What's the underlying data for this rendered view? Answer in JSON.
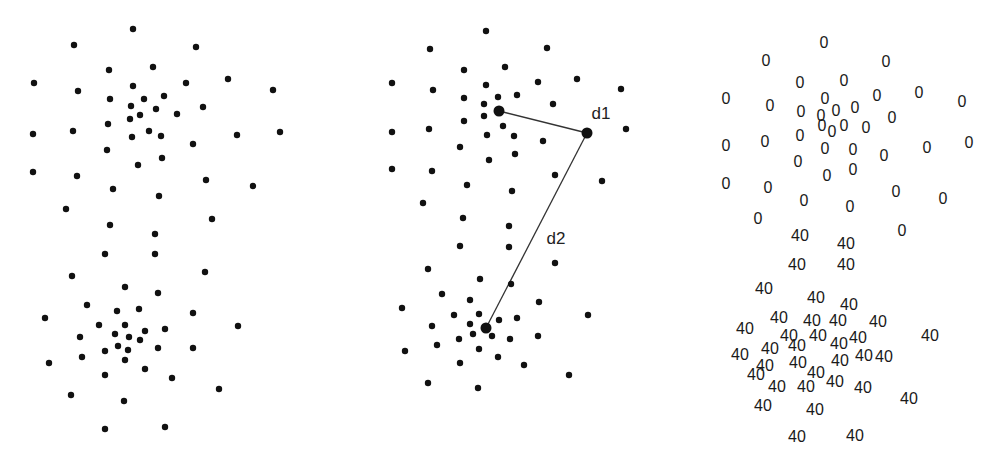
{
  "figure": {
    "panels": [
      {
        "id": "panel-raw-points",
        "description": "Two clusters of unlabeled points",
        "point_radius": 3.2,
        "points": [
          [
            133,
            29
          ],
          [
            74,
            45
          ],
          [
            196,
            47
          ],
          [
            109,
            70
          ],
          [
            153,
            67
          ],
          [
            34,
            83
          ],
          [
            78,
            91
          ],
          [
            133,
            86
          ],
          [
            186,
            83
          ],
          [
            228,
            79
          ],
          [
            273,
            90
          ],
          [
            110,
            99
          ],
          [
            144,
            99
          ],
          [
            164,
            96
          ],
          [
            131,
            106
          ],
          [
            156,
            109
          ],
          [
            177,
            114
          ],
          [
            203,
            107
          ],
          [
            130,
            119
          ],
          [
            140,
            115
          ],
          [
            108,
            124
          ],
          [
            33,
            134
          ],
          [
            73,
            131
          ],
          [
            132,
            137
          ],
          [
            149,
            131
          ],
          [
            161,
            136
          ],
          [
            237,
            135
          ],
          [
            280,
            132
          ],
          [
            193,
            144
          ],
          [
            107,
            150
          ],
          [
            138,
            165
          ],
          [
            162,
            158
          ],
          [
            33,
            172
          ],
          [
            77,
            176
          ],
          [
            113,
            189
          ],
          [
            206,
            180
          ],
          [
            253,
            186
          ],
          [
            66,
            209
          ],
          [
            159,
            196
          ],
          [
            110,
            225
          ],
          [
            212,
            219
          ],
          [
            155,
            234
          ],
          [
            105,
            254
          ],
          [
            155,
            254
          ],
          [
            72,
            276
          ],
          [
            205,
            272
          ],
          [
            125,
            287
          ],
          [
            158,
            293
          ],
          [
            87,
            305
          ],
          [
            117,
            311
          ],
          [
            139,
            309
          ],
          [
            193,
            313
          ],
          [
            45,
            318
          ],
          [
            99,
            325
          ],
          [
            125,
            325
          ],
          [
            145,
            331
          ],
          [
            165,
            329
          ],
          [
            238,
            326
          ],
          [
            80,
            337
          ],
          [
            115,
            334
          ],
          [
            129,
            337
          ],
          [
            105,
            351
          ],
          [
            140,
            340
          ],
          [
            118,
            346
          ],
          [
            158,
            348
          ],
          [
            128,
            350
          ],
          [
            193,
            348
          ],
          [
            49,
            363
          ],
          [
            82,
            357
          ],
          [
            125,
            360
          ],
          [
            145,
            369
          ],
          [
            172,
            378
          ],
          [
            105,
            375
          ],
          [
            219,
            389
          ],
          [
            71,
            395
          ],
          [
            124,
            401
          ],
          [
            105,
            429
          ],
          [
            165,
            427
          ]
        ]
      },
      {
        "id": "panel-distances",
        "description": "Points with two highlighted distances",
        "point_radius": 3.2,
        "highlight_radius": 5.5,
        "points": [
          [
            486,
            31
          ],
          [
            430,
            49
          ],
          [
            547,
            48
          ],
          [
            464,
            70
          ],
          [
            505,
            67
          ],
          [
            392,
            83
          ],
          [
            433,
            90
          ],
          [
            486,
            85
          ],
          [
            538,
            82
          ],
          [
            577,
            79
          ],
          [
            621,
            89
          ],
          [
            464,
            98
          ],
          [
            498,
            97
          ],
          [
            517,
            95
          ],
          [
            484,
            104
          ],
          [
            553,
            104
          ],
          [
            484,
            116
          ],
          [
            464,
            121
          ],
          [
            503,
            126
          ],
          [
            392,
            132
          ],
          [
            429,
            129
          ],
          [
            487,
            135
          ],
          [
            514,
            136
          ],
          [
            543,
            141
          ],
          [
            460,
            147
          ],
          [
            489,
            160
          ],
          [
            515,
            154
          ],
          [
            392,
            169
          ],
          [
            432,
            171
          ],
          [
            555,
            175
          ],
          [
            602,
            181
          ],
          [
            467,
            185
          ],
          [
            512,
            191
          ],
          [
            423,
            203
          ],
          [
            463,
            218
          ],
          [
            509,
            226
          ],
          [
            626,
            129
          ],
          [
            460,
            246
          ],
          [
            509,
            247
          ],
          [
            428,
            269
          ],
          [
            480,
            279
          ],
          [
            511,
            284
          ],
          [
            555,
            263
          ],
          [
            442,
            294
          ],
          [
            470,
            300
          ],
          [
            402,
            308
          ],
          [
            454,
            315
          ],
          [
            479,
            314
          ],
          [
            499,
            320
          ],
          [
            517,
            318
          ],
          [
            432,
            326
          ],
          [
            470,
            324
          ],
          [
            539,
            302
          ],
          [
            588,
            315
          ],
          [
            473,
            334
          ],
          [
            459,
            339
          ],
          [
            492,
            336
          ],
          [
            510,
            339
          ],
          [
            538,
            336
          ],
          [
            405,
            351
          ],
          [
            437,
            345
          ],
          [
            479,
            349
          ],
          [
            498,
            357
          ],
          [
            460,
            363
          ],
          [
            524,
            365
          ],
          [
            569,
            375
          ],
          [
            428,
            383
          ],
          [
            478,
            388
          ]
        ],
        "highlighted_points": [
          {
            "name": "point-a",
            "x": 499,
            "y": 111
          },
          {
            "name": "point-b",
            "x": 587,
            "y": 133
          },
          {
            "name": "point-c",
            "x": 486,
            "y": 328
          }
        ],
        "distances": [
          {
            "name": "d1",
            "label": "d1",
            "from": [
              499,
              111
            ],
            "to": [
              587,
              133
            ],
            "label_pos": [
              601,
              113
            ]
          },
          {
            "name": "d2",
            "label": "d2",
            "from": [
              587,
              133
            ],
            "to": [
              486,
              328
            ],
            "label_pos": [
              556,
              238
            ]
          }
        ]
      },
      {
        "id": "panel-labeled",
        "description": "Points replaced by cluster labels",
        "cluster_labels": [
          {
            "label": "0",
            "positions": [
              [
                824,
                42
              ],
              [
                766,
                60
              ],
              [
                886,
                61
              ],
              [
                800,
                82
              ],
              [
                844,
                80
              ],
              [
                726,
                98
              ],
              [
                770,
                105
              ],
              [
                825,
                98
              ],
              [
                877,
                95
              ],
              [
                919,
                92
              ],
              [
                962,
                101
              ],
              [
                801,
                111
              ],
              [
                821,
                115
              ],
              [
                836,
                110
              ],
              [
                855,
                107
              ],
              [
                892,
                117
              ],
              [
                822,
                125
              ],
              [
                800,
                135
              ],
              [
                832,
                131
              ],
              [
                844,
                125
              ],
              [
                866,
                127
              ],
              [
                726,
                145
              ],
              [
                765,
                141
              ],
              [
                825,
                148
              ],
              [
                853,
                149
              ],
              [
                884,
                155
              ],
              [
                927,
                147
              ],
              [
                969,
                142
              ],
              [
                798,
                161
              ],
              [
                827,
                175
              ],
              [
                853,
                169
              ],
              [
                726,
                183
              ],
              [
                768,
                187
              ],
              [
                804,
                200
              ],
              [
                850,
                206
              ],
              [
                896,
                191
              ],
              [
                943,
                198
              ],
              [
                758,
                218
              ],
              [
                902,
                230
              ]
            ]
          },
          {
            "label": "40",
            "positions": [
              [
                800,
                235
              ],
              [
                846,
                243
              ],
              [
                797,
                264
              ],
              [
                846,
                264
              ],
              [
                764,
                288
              ],
              [
                816,
                297
              ],
              [
                849,
                304
              ],
              [
                745,
                328
              ],
              [
                779,
                317
              ],
              [
                812,
                320
              ],
              [
                838,
                320
              ],
              [
                878,
                321
              ],
              [
                740,
                354
              ],
              [
                789,
                335
              ],
              [
                818,
                335
              ],
              [
                839,
                343
              ],
              [
                858,
                337
              ],
              [
                930,
                335
              ],
              [
                770,
                348
              ],
              [
                797,
                345
              ],
              [
                840,
                360
              ],
              [
                864,
                355
              ],
              [
                884,
                356
              ],
              [
                765,
                365
              ],
              [
                798,
                362
              ],
              [
                816,
                372
              ],
              [
                756,
                374
              ],
              [
                835,
                381
              ],
              [
                777,
                386
              ],
              [
                806,
                386
              ],
              [
                863,
                387
              ],
              [
                909,
                398
              ],
              [
                763,
                405
              ],
              [
                815,
                409
              ],
              [
                797,
                436
              ],
              [
                855,
                435
              ]
            ]
          }
        ]
      }
    ],
    "colors": {
      "point": "#111111",
      "line": "#333333",
      "text": "#1a1a1a",
      "background": "#ffffff"
    }
  }
}
